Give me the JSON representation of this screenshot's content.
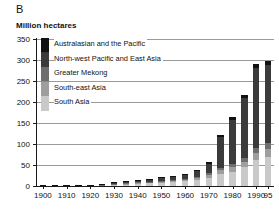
{
  "panel": {
    "letter": "B"
  },
  "axis": {
    "y_caption": "Million hectares",
    "y_ticks": [
      "350",
      "300",
      "250",
      "200",
      "150",
      "100",
      "50",
      "0"
    ],
    "x_ticks": [
      "1900",
      "1910",
      "1920",
      "1930",
      "1940",
      "1950",
      "1960",
      "1970",
      "1980",
      "1990",
      "95"
    ]
  },
  "legend": {
    "items": [
      {
        "label": "Australasian and the Pacific",
        "color": "#111111"
      },
      {
        "label": "North-west Pacific and East Asia",
        "color": "#3b3b3b"
      },
      {
        "label": "Greater Mekong",
        "color": "#6e6e6e"
      },
      {
        "label": "South-east Asia",
        "color": "#9e9e9e"
      },
      {
        "label": "South Asia",
        "color": "#c9c9c9"
      }
    ]
  },
  "chart_data": {
    "type": "bar",
    "title": "B",
    "xlabel": "",
    "ylabel": "Million hectares",
    "ylim": [
      0,
      350
    ],
    "grid": true,
    "stacked": true,
    "legend_position": "upper-left",
    "categories": [
      "1900",
      "1905",
      "1910",
      "1915",
      "1920",
      "1925",
      "1930",
      "1935",
      "1940",
      "1945",
      "1950",
      "1955",
      "1960",
      "1965",
      "1970",
      "1975",
      "1980",
      "1985",
      "1990",
      "1995"
    ],
    "series": [
      {
        "name": "South Asia",
        "color": "#c9c9c9",
        "values": [
          0.3,
          0.4,
          0.5,
          0.7,
          0.9,
          1.5,
          3.0,
          4.5,
          5.5,
          6.5,
          8.0,
          9.5,
          11.0,
          14.0,
          19.0,
          29.0,
          34.0,
          45.0,
          63.0,
          70.0
        ]
      },
      {
        "name": "South-east Asia",
        "color": "#9e9e9e",
        "values": [
          0.1,
          0.1,
          0.2,
          0.2,
          0.3,
          0.5,
          1.0,
          1.5,
          2.0,
          2.5,
          3.0,
          3.5,
          4.0,
          5.0,
          7.0,
          9.0,
          11.0,
          13.0,
          16.0,
          18.0
        ]
      },
      {
        "name": "Greater Mekong",
        "color": "#6e6e6e",
        "values": [
          0.1,
          0.1,
          0.1,
          0.2,
          0.2,
          0.3,
          0.6,
          0.8,
          1.0,
          1.2,
          1.5,
          2.0,
          2.5,
          3.0,
          4.0,
          5.0,
          7.0,
          9.0,
          12.0,
          14.0
        ]
      },
      {
        "name": "North-west Pacific and East Asia",
        "color": "#3b3b3b",
        "values": [
          0.2,
          0.3,
          0.4,
          0.5,
          0.7,
          1.5,
          3.0,
          4.0,
          5.0,
          6.0,
          7.0,
          8.5,
          10.0,
          13.0,
          23.0,
          74.0,
          105.0,
          142.0,
          190.0,
          186.0
        ]
      },
      {
        "name": "Australasian and the Pacific",
        "color": "#111111",
        "values": [
          0.0,
          0.0,
          0.0,
          0.1,
          0.1,
          0.2,
          0.4,
          0.5,
          0.7,
          0.9,
          1.2,
          1.5,
          2.0,
          2.5,
          3.5,
          5.0,
          7.0,
          8.0,
          9.0,
          9.0
        ]
      }
    ],
    "totals": [
      0.7,
      0.9,
      1.2,
      1.7,
      2.2,
      4.0,
      8.0,
      11.3,
      14.2,
      17.1,
      20.7,
      25.0,
      29.5,
      37.5,
      56.5,
      122.0,
      164.0,
      217.0,
      290.0,
      297.0
    ]
  }
}
